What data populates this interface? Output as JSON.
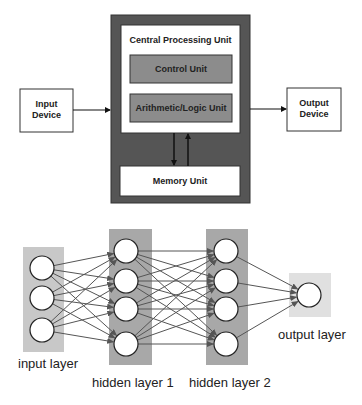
{
  "cpu_diagram": {
    "cpu_title": "Central Processing Unit",
    "control_unit": "Control Unit",
    "alu": "Arithmetic/Logic Unit",
    "memory_unit": "Memory Unit",
    "input_device": [
      "Input",
      "Device"
    ],
    "output_device": [
      "Output",
      "Device"
    ],
    "colors": {
      "outer": "#555555",
      "inner_unit": "#8c8c8c",
      "box_fill": "#ffffff"
    }
  },
  "neural_network": {
    "layers": [
      {
        "label": "input layer",
        "nodes": 3
      },
      {
        "label": "hidden layer 1",
        "nodes": 4
      },
      {
        "label": "hidden layer 2",
        "nodes": 4
      },
      {
        "label": "output layer",
        "nodes": 1
      }
    ],
    "colors": {
      "input_bg": "#c8c8c8",
      "hidden_bg": "#a8a8a8",
      "output_bg": "#e0e0e0",
      "edge": "#555555"
    }
  }
}
